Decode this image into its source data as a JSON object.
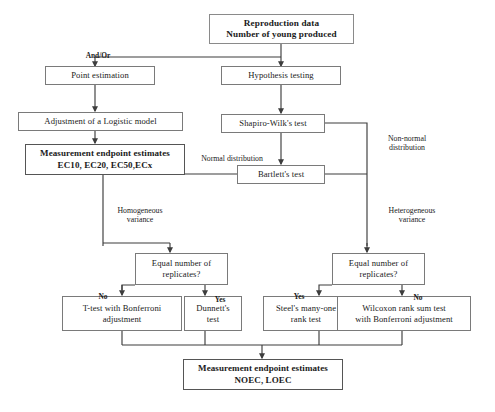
{
  "diagram": {
    "title_node": {
      "id": "reproduction-data",
      "text": "Reproduction data\nNumber of young produced"
    },
    "nodes": [
      {
        "id": "point-estimation",
        "text": "Point estimation"
      },
      {
        "id": "hypothesis-testing",
        "text": "Hypothesis testing"
      },
      {
        "id": "logistic-model",
        "text": "Adjustment of a Logistic model"
      },
      {
        "id": "shapiro-wilk",
        "text": "Shapiro-Wilk's test"
      },
      {
        "id": "endpoint-ec",
        "text": "Measurement endpoint estimates\nEC10, EC20, EC50,ECx"
      },
      {
        "id": "bartlett",
        "text": "Bartlett's test"
      },
      {
        "id": "equal-replicates-left",
        "text": "Equal number of\nreplicates?"
      },
      {
        "id": "equal-replicates-right",
        "text": "Equal number of\nreplicates?"
      },
      {
        "id": "t-test-bonferroni",
        "text": "T-test with Bonferroni\nadjustment"
      },
      {
        "id": "dunnett",
        "text": "Dunnett's\ntest"
      },
      {
        "id": "steel-rank",
        "text": "Steel's many-one\nrank test"
      },
      {
        "id": "wilcoxon",
        "text": "Wilcoxon rank sum test\nwith Bonferroni adjustment"
      },
      {
        "id": "endpoint-noec",
        "text": "Measurement endpoint estimates\nNOEC, LOEC"
      }
    ],
    "edge_labels": [
      {
        "id": "and-or",
        "text": "And/Or"
      },
      {
        "id": "normal-distribution",
        "text": "Normal distribution"
      },
      {
        "id": "non-normal-distribution",
        "text": "Non-normal\ndistribution"
      },
      {
        "id": "homogeneous-variance",
        "text": "Homogeneous\nvariance"
      },
      {
        "id": "heterogeneous-variance",
        "text": "Heterogeneous\nvariance"
      },
      {
        "id": "no-left",
        "text": "No"
      },
      {
        "id": "yes-left",
        "text": "Yes"
      },
      {
        "id": "yes-right",
        "text": "Yes"
      },
      {
        "id": "no-right",
        "text": "No"
      }
    ],
    "colors": {
      "box_border": "#7a7a7a",
      "emph_border": "#555555",
      "line": "#3d3d3d",
      "text": "#1a1a1a",
      "background": "#ffffff"
    }
  }
}
